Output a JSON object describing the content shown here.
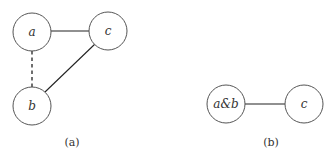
{
  "panels": [
    {
      "caption": "(a)",
      "nodes": [
        {
          "id": "a",
          "label": "a"
        },
        {
          "id": "c",
          "label": "c"
        },
        {
          "id": "b",
          "label": "b"
        }
      ],
      "edges": [
        {
          "from": "a",
          "to": "c",
          "style": "solid"
        },
        {
          "from": "a",
          "to": "b",
          "style": "dashed"
        },
        {
          "from": "b",
          "to": "c",
          "style": "solid"
        }
      ]
    },
    {
      "caption": "(b)",
      "nodes": [
        {
          "id": "ab",
          "label": "a&b"
        },
        {
          "id": "c",
          "label": "c"
        }
      ],
      "edges": [
        {
          "from": "ab",
          "to": "c",
          "style": "solid"
        }
      ]
    }
  ]
}
